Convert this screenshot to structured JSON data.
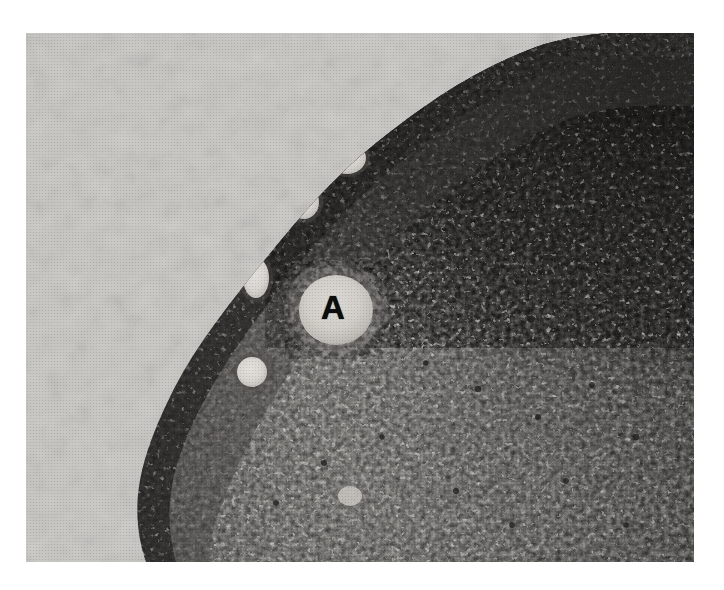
{
  "figure": {
    "kind": "photomicrograph",
    "modality": "brightfield-light-microscopy",
    "rendering": "black-and-white halftone print",
    "page_background": "#ffffff",
    "plate": {
      "x": 26,
      "y": 33,
      "width": 668,
      "height": 529,
      "empty_field_color": "#c9c7c3",
      "tissue_mid_color": "#9d9a95",
      "tissue_dark_color": "#2b2a28",
      "tissue_light_color": "#d5d3ce",
      "follicle_lumen_color": "#dedcd7"
    },
    "annotations": [
      {
        "name": "label-a",
        "text": "A",
        "x": 333,
        "y": 309,
        "color": "#0d0d0d",
        "font_size_px": 33,
        "bold": true,
        "points_to": "central pale follicle / vesicle"
      }
    ],
    "regions": [
      {
        "name": "empty-background",
        "description": "blank light-gray slide field, upper-left corner outside the tissue",
        "tone": "light"
      },
      {
        "name": "tissue-margin",
        "description": "dark basophilic cell-dense rim following the curved tissue border from upper-middle down to lower-left",
        "tone": "dark"
      },
      {
        "name": "dense-nuclei-zone",
        "description": "very dark densely packed nuclei occupying the upper-right quadrant",
        "tone": "very dark"
      },
      {
        "name": "pale-stroma-zone",
        "description": "paler loose stroma in the lower-central and lower-right portion",
        "tone": "mid-light"
      }
    ],
    "follicles": [
      {
        "name": "follicle-1",
        "cx": 347,
        "cy": 158,
        "rx": 21,
        "ry": 18
      },
      {
        "name": "follicle-2",
        "cx": 304,
        "cy": 202,
        "rx": 17,
        "ry": 19
      },
      {
        "name": "follicle-3",
        "cx": 256,
        "cy": 278,
        "rx": 15,
        "ry": 22
      },
      {
        "name": "follicle-4",
        "cx": 252,
        "cy": 372,
        "rx": 17,
        "ry": 17
      },
      {
        "name": "follicle-central-a",
        "cx": 336,
        "cy": 310,
        "rx": 44,
        "ry": 42
      },
      {
        "name": "follicle-5",
        "cx": 350,
        "cy": 496,
        "rx": 14,
        "ry": 12
      }
    ]
  }
}
